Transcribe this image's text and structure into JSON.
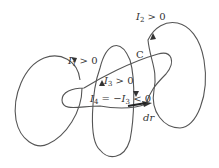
{
  "diagram": {
    "type": "ampere-loop-currents",
    "stroke_color": "#555555",
    "labels": {
      "I1": {
        "sym": "I",
        "sub": "1",
        "rel": " > 0"
      },
      "I2": {
        "sym": "I",
        "sub": "2",
        "rel": " > 0"
      },
      "I3": {
        "sym": "I",
        "sub": "3",
        "rel": " > 0"
      },
      "I4": {
        "sym": "I",
        "sub": "4",
        "mid": " = −",
        "sym2": "I",
        "sub2": "3",
        "rel": " < 0"
      },
      "C": "C",
      "dr": "dr"
    }
  }
}
